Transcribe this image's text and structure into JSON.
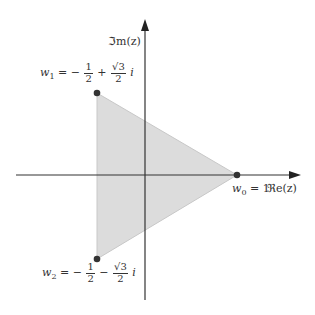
{
  "diagram": {
    "axes": {
      "real_label": "ℜe(z)",
      "imag_label": "ℑm(z)"
    },
    "points": [
      {
        "id": "w0",
        "name": "w",
        "sub": "0",
        "eq": "= 1",
        "re": 1,
        "im": 0
      },
      {
        "id": "w1",
        "name": "w",
        "sub": "1",
        "eq": "= −",
        "frac1_num": "1",
        "frac1_den": "2",
        "op": "+",
        "frac2_num": "√3",
        "frac2_den": "2",
        "unit": "i",
        "re": -0.5,
        "im": 0.866
      },
      {
        "id": "w2",
        "name": "w",
        "sub": "2",
        "eq": "= −",
        "frac1_num": "1",
        "frac1_den": "2",
        "op": "−",
        "frac2_num": "√3",
        "frac2_den": "2",
        "unit": "i",
        "re": -0.5,
        "im": -0.866
      }
    ],
    "colors": {
      "fill": "#dcdcdc",
      "edge": "#c8c8c8",
      "axis": "#333333",
      "point": "#333333"
    }
  }
}
